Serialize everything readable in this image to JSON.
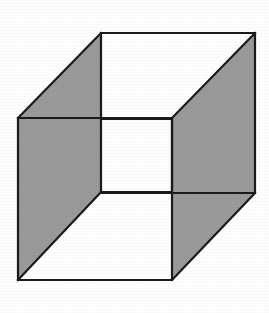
{
  "figure": {
    "type": "line-drawing",
    "caption": "Necker cube",
    "background_color": "#ffffff",
    "shaded_face_color": "#9a9a9a",
    "white_face_color": "#ffffff",
    "edge_color": "#1a1a1a",
    "edge_width_px": 2.2,
    "canvas": {
      "width": 269,
      "height": 313
    },
    "vertices": {
      "front_top_left": [
        18,
        118
      ],
      "front_top_right": [
        172,
        118
      ],
      "front_bottom_right": [
        172,
        280
      ],
      "front_bottom_left": [
        18,
        280
      ],
      "back_top_left": [
        101,
        33
      ],
      "back_top_right": [
        255,
        33
      ],
      "back_bottom_right": [
        255,
        193
      ],
      "back_bottom_left": [
        101,
        193
      ],
      "inner_top_left": [
        101,
        119
      ],
      "inner_top_right": [
        172,
        119
      ],
      "inner_bottom_right": [
        172,
        192
      ],
      "inner_bottom_left": [
        101,
        192
      ]
    },
    "faces": [
      {
        "name": "left-face",
        "shading": "gray",
        "points": "18,118 101,33 101,192 18,280"
      },
      {
        "name": "right-face",
        "shading": "gray",
        "points": "172,119 255,33 255,193 172,280"
      },
      {
        "name": "top-face",
        "shading": "white",
        "points": "101,33 255,33 172,119 101,119"
      },
      {
        "name": "bottom-face",
        "shading": "white",
        "points": "18,280 101,192 172,192 172,280"
      },
      {
        "name": "inner-square-face",
        "shading": "white",
        "points": "101,119 172,119 172,192 101,192"
      }
    ],
    "edges": [
      {
        "name": "front-top-edge",
        "from": [
          18,
          118
        ],
        "to": [
          172,
          118
        ]
      },
      {
        "name": "front-right-edge",
        "from": [
          172,
          118
        ],
        "to": [
          172,
          280
        ]
      },
      {
        "name": "front-bottom-edge",
        "from": [
          172,
          280
        ],
        "to": [
          18,
          280
        ]
      },
      {
        "name": "front-left-edge",
        "from": [
          18,
          280
        ],
        "to": [
          18,
          118
        ]
      },
      {
        "name": "back-top-edge",
        "from": [
          101,
          33
        ],
        "to": [
          255,
          33
        ]
      },
      {
        "name": "back-right-edge",
        "from": [
          255,
          33
        ],
        "to": [
          255,
          193
        ]
      },
      {
        "name": "back-bottom-edge",
        "from": [
          255,
          193
        ],
        "to": [
          172,
          193
        ]
      },
      {
        "name": "back-left-edge",
        "from": [
          101,
          33
        ],
        "to": [
          101,
          192
        ]
      },
      {
        "name": "connector-top-left",
        "from": [
          18,
          118
        ],
        "to": [
          101,
          33
        ]
      },
      {
        "name": "connector-top-right",
        "from": [
          172,
          118
        ],
        "to": [
          255,
          33
        ]
      },
      {
        "name": "connector-bottom-left",
        "from": [
          18,
          280
        ],
        "to": [
          101,
          192
        ]
      },
      {
        "name": "connector-bottom-right",
        "from": [
          172,
          280
        ],
        "to": [
          255,
          193
        ]
      },
      {
        "name": "inner-bottom-edge",
        "from": [
          101,
          192
        ],
        "to": [
          172,
          192
        ]
      }
    ]
  }
}
